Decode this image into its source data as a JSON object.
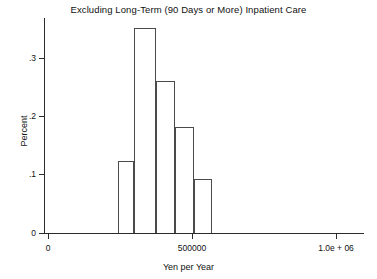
{
  "chart_data": {
    "type": "bar",
    "title": "Excluding Long-Term (90 Days or More) Inpatient Care",
    "subtitle": "",
    "xlabel": "Yen per Year",
    "ylabel": "Percent",
    "grid": false,
    "legend": false,
    "xlim": [
      0,
      1000000
    ],
    "ylim": [
      0,
      0.36
    ],
    "x_tick_values": [
      0,
      500000,
      1000000
    ],
    "x_tick_labels": [
      "0",
      "500000",
      "1.0e + 06"
    ],
    "y_tick_values": [
      0,
      0.1,
      0.2,
      0.3
    ],
    "y_tick_labels": [
      "0",
      ".1",
      ".2",
      ".3"
    ],
    "bin_edges": [
      230000,
      280000,
      350000,
      410000,
      470000,
      525000
    ],
    "categories": [
      "230000-280000",
      "280000-350000",
      "350000-410000",
      "410000-470000",
      "470000-525000"
    ],
    "values": [
      0.122,
      0.347,
      0.257,
      0.18,
      0.091
    ],
    "annotations": []
  },
  "bars": [
    {
      "label": "bin-1",
      "value": 0.122,
      "left_px": 118,
      "width_px": 16
    },
    {
      "label": "bin-2",
      "value": 0.347,
      "left_px": 134,
      "width_px": 22
    },
    {
      "label": "bin-3",
      "value": 0.257,
      "left_px": 156,
      "width_px": 19
    },
    {
      "label": "bin-4",
      "value": 0.18,
      "left_px": 175,
      "width_px": 19
    },
    {
      "label": "bin-5",
      "value": 0.091,
      "left_px": 194,
      "width_px": 18
    }
  ],
  "axes": {
    "y_ticks": [
      {
        "label": "0",
        "value": 0.0,
        "y_px": 233
      },
      {
        "label": ".1",
        "value": 0.1,
        "y_px": 174
      },
      {
        "label": ".2",
        "value": 0.2,
        "y_px": 116
      },
      {
        "label": ".3",
        "value": 0.3,
        "y_px": 58
      }
    ],
    "x_ticks": [
      {
        "label": "0",
        "value": 0,
        "x_px": 48
      },
      {
        "label": "500000",
        "value": 500000,
        "x_px": 192
      },
      {
        "label": "1.0e + 06",
        "value": 1000000,
        "x_px": 336
      }
    ]
  },
  "style": {
    "axis_color": "#2b2b2b",
    "bar_edge_color": "#4a4a4a",
    "bar_fill_color": "#ffffff",
    "background": "#ffffff",
    "text_color": "#111111"
  }
}
